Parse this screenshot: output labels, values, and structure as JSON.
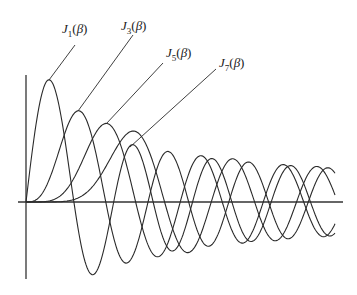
{
  "chart_data": {
    "type": "line",
    "title": "",
    "xlabel": "",
    "ylabel": "",
    "grid": false,
    "legend_position": "inline leader-line labels",
    "x_range": [
      0,
      24.7
    ],
    "y_range": [
      -0.36,
      0.6
    ],
    "series": [
      {
        "name": "J1(β)",
        "order": 1,
        "first_max": {
          "x": 1.84,
          "y": 0.58
        },
        "first_min": {
          "x": 5.33,
          "y": -0.35
        }
      },
      {
        "name": "J3(β)",
        "order": 3,
        "first_max": {
          "x": 4.2,
          "y": 0.43
        }
      },
      {
        "name": "J5(β)",
        "order": 5,
        "first_max": {
          "x": 6.42,
          "y": 0.37
        }
      },
      {
        "name": "J7(β)",
        "order": 7,
        "first_max": {
          "x": 8.58,
          "y": 0.34
        }
      }
    ],
    "labels": [
      {
        "func": "J",
        "sub": "1",
        "arg": "β"
      },
      {
        "func": "J",
        "sub": "3",
        "arg": "β"
      },
      {
        "func": "J",
        "sub": "5",
        "arg": "β"
      },
      {
        "func": "J",
        "sub": "7",
        "arg": "β"
      }
    ]
  },
  "layout": {
    "origin_px": [
      26,
      202
    ],
    "x_scale_px_per_unit": 12.5,
    "y_scale_px_per_unit": 210,
    "curve_end_px": 335,
    "x_axis_px": [
      18,
      343
    ],
    "y_axis_px": [
      75,
      279
    ],
    "label_positions": [
      {
        "left": 62,
        "top": 22,
        "leader": [
          75,
          45,
          49,
          80
        ]
      },
      {
        "left": 121,
        "top": 19,
        "leader": [
          133,
          35,
          78,
          111
        ]
      },
      {
        "left": 166,
        "top": 46,
        "leader": [
          163,
          63,
          106,
          124
        ]
      },
      {
        "left": 219,
        "top": 56,
        "leader": [
          216,
          69,
          130,
          147
        ]
      }
    ]
  }
}
